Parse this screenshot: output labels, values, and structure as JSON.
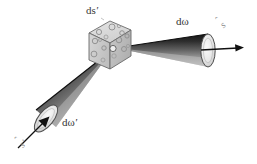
{
  "figure": {
    "width": 257,
    "height": 164,
    "background_color": "#ffffff"
  },
  "labels": {
    "volume_element": "ds",
    "volume_element_prime": "′",
    "outgoing_solid_angle": "dω",
    "incoming_solid_angle": "dω",
    "incoming_solid_angle_prime": "′",
    "outgoing_direction": "s",
    "outgoing_direction_hat": "ˆ",
    "incoming_direction": "s",
    "incoming_direction_hat": "ˆ",
    "incoming_direction_prime": "′"
  },
  "colors": {
    "cone_dark": "#1b1b1b",
    "cone_mid": "#6e6e6e",
    "cone_light": "#d8d8d8",
    "cap_fill": "#e9e9e9",
    "cube_top": "#dcdcdc",
    "cube_left": "#c9c9c9",
    "cube_right": "#bdbdbd",
    "cube_edge": "#6a6a6a",
    "particle_stroke": "#8d8d8d",
    "arrow": "#111111",
    "text": "#2a2a2a",
    "vector_label": "#8f8f8f"
  },
  "elements": {
    "scatter_volume_name": "scattering volume element",
    "right_cone_name": "outgoing scattered cone",
    "left_cone_name": "incident cone",
    "right_arrow_name": "outgoing direction arrow",
    "left_arrow_name": "incident direction arrow"
  }
}
